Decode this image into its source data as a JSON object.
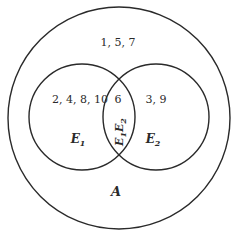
{
  "diagram": {
    "type": "venn",
    "universe": {
      "label": "A",
      "outside_elements": "1, 5, 7"
    },
    "sets": [
      {
        "name": "E",
        "sub": "1",
        "only_elements": "2, 4, 8, 10"
      },
      {
        "name": "E",
        "sub": "2",
        "only_elements": "3, 9"
      }
    ],
    "intersection": {
      "elements": "6",
      "label_a": "E",
      "sub_a": "1",
      "label_b": "E",
      "sub_b": "2"
    },
    "stroke_color": "#2a2a2a"
  }
}
